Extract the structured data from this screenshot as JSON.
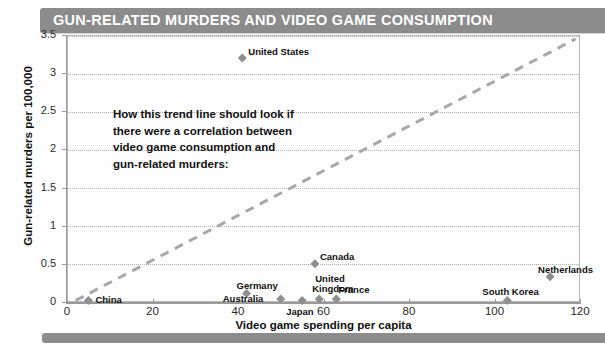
{
  "header": {
    "title": "GUN-RELATED MURDERS AND VIDEO GAME CONSUMPTION",
    "bar_color": "#8c8c8c",
    "text_color": "#ffffff"
  },
  "footer": {
    "bar_color": "#8c8c8c"
  },
  "annotation": {
    "line1": "How this trend line should look if",
    "line2": "there were a correlation between",
    "line3": "video game consumption and",
    "line4": "gun-related murders:"
  },
  "chart_data": {
    "type": "scatter",
    "title": "GUN-RELATED MURDERS AND VIDEO GAME CONSUMPTION",
    "xlabel": "Video game spending per capita",
    "ylabel": "Gun-related murders per 100,000",
    "xlim": [
      0,
      120
    ],
    "ylim": [
      0,
      3.5
    ],
    "xticks": [
      "0",
      "20",
      "40",
      "60",
      "80",
      "100",
      "120"
    ],
    "xtick_values": [
      0,
      20,
      40,
      60,
      80,
      100,
      120
    ],
    "yticks": [
      "0",
      "0.5",
      "1",
      "1.5",
      "2",
      "2.5",
      "3",
      "3.5"
    ],
    "ytick_values": [
      0,
      0.5,
      1,
      1.5,
      2,
      2.5,
      3,
      3.5
    ],
    "grid": "horizontal-dotted",
    "legend": "none",
    "marker_color": "#8e8e8e",
    "marker_shape": "diamond",
    "points": [
      {
        "label": "United States",
        "x": 41,
        "y": 3.2,
        "label_dx": 6,
        "label_dy": -12
      },
      {
        "label": "Canada",
        "x": 58,
        "y": 0.5,
        "label_dx": 5,
        "label_dy": -13
      },
      {
        "label": "Netherlands",
        "x": 113,
        "y": 0.33,
        "label_dx": -12,
        "label_dy": -13
      },
      {
        "label": "Germany",
        "x": 42,
        "y": 0.11,
        "label_dx": -10,
        "label_dy": -14
      },
      {
        "label": "Australia",
        "x": 50,
        "y": 0.04,
        "label_dx": -58,
        "label_dy": -6
      },
      {
        "label": "Japan",
        "x": 55,
        "y": 0.02,
        "label_dx": -16,
        "label_dy": 6
      },
      {
        "label": "United",
        "x": 59,
        "y": 0.04,
        "label_dx": -4,
        "label_dy": -26
      },
      {
        "label": "Kingdom",
        "x": 59,
        "y": 0.04,
        "label_dx": -7,
        "label_dy": -16
      },
      {
        "label": "France",
        "x": 63,
        "y": 0.04,
        "label_dx": 2,
        "label_dy": -15
      },
      {
        "label": "South Korea",
        "x": 103,
        "y": 0.02,
        "label_dx": -25,
        "label_dy": -14
      },
      {
        "label": "China",
        "x": 5,
        "y": 0.02,
        "label_dx": 7,
        "label_dy": -6
      }
    ],
    "trendline": {
      "style": "dashed",
      "color": "#a8a8a8",
      "from": [
        2,
        0.02
      ],
      "to": [
        119,
        3.45
      ],
      "note": "Hypothetical correlation line, not fitted to data"
    }
  }
}
